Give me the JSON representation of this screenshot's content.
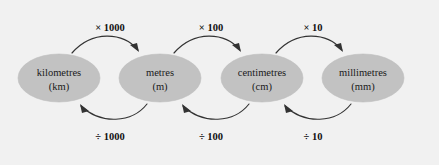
{
  "diagram": {
    "background_color": "#f1f1f1",
    "node_fill_color": "#c2c2c2",
    "arrow_color": "#333333",
    "nodes": [
      {
        "id": "km",
        "name": "kilometres",
        "abbrev": "(km)",
        "cx": 59,
        "cy": 78,
        "rx": 41,
        "ry": 24
      },
      {
        "id": "m",
        "name": "metres",
        "abbrev": "(m)",
        "cx": 160,
        "cy": 78,
        "rx": 41,
        "ry": 24
      },
      {
        "id": "cm",
        "name": "centimetres",
        "abbrev": "(cm)",
        "cx": 262,
        "cy": 78,
        "rx": 41,
        "ry": 24
      },
      {
        "id": "mm",
        "name": "millimetres",
        "abbrev": "(mm)",
        "cx": 363,
        "cy": 78,
        "rx": 41,
        "ry": 24
      }
    ],
    "multiply_edges": [
      {
        "id": "km-to-m",
        "label": "× 1000",
        "from": "km",
        "to": "m",
        "label_x": 110,
        "label_y": 31
      },
      {
        "id": "m-to-cm",
        "label": "× 100",
        "from": "m",
        "to": "cm",
        "label_x": 211,
        "label_y": 31
      },
      {
        "id": "cm-to-mm",
        "label": "× 10",
        "from": "cm",
        "to": "mm",
        "label_x": 313,
        "label_y": 31
      }
    ],
    "divide_edges": [
      {
        "id": "m-to-km",
        "label": "÷ 1000",
        "from": "m",
        "to": "km",
        "label_x": 110,
        "label_y": 140
      },
      {
        "id": "cm-to-m",
        "label": "÷ 100",
        "from": "cm",
        "to": "m",
        "label_x": 211,
        "label_y": 140
      },
      {
        "id": "mm-to-cm",
        "label": "÷ 10",
        "from": "mm",
        "to": "cm",
        "label_x": 313,
        "label_y": 140
      }
    ]
  }
}
